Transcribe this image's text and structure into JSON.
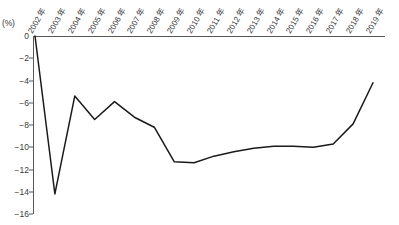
{
  "chart_data": {
    "type": "line",
    "title": "",
    "xlabel": "",
    "ylabel": "(%)",
    "categories": [
      "2002 年",
      "2003 年",
      "2004 年",
      "2005 年",
      "2006 年",
      "2007 年",
      "2008 年",
      "2009 年",
      "2010 年",
      "2011 年",
      "2012 年",
      "2013 年",
      "2014 年",
      "2015 年",
      "2016 年",
      "2017 年",
      "2018 年",
      "2019 年"
    ],
    "values": [
      0,
      -14.2,
      -5.4,
      -7.5,
      -5.9,
      -7.3,
      -8.2,
      -11.3,
      -11.4,
      -10.8,
      -10.4,
      -10.1,
      -9.9,
      -9.9,
      -10.0,
      -9.7,
      -7.9,
      -4.2
    ],
    "series": [
      {
        "name": "",
        "values": [
          0,
          -14.2,
          -5.4,
          -7.5,
          -5.9,
          -7.3,
          -8.2,
          -11.3,
          -11.4,
          -10.8,
          -10.4,
          -10.1,
          -9.9,
          -9.9,
          -10.0,
          -9.7,
          -7.9,
          -4.2
        ]
      }
    ],
    "ylim": [
      -16,
      0
    ],
    "yticks": [
      0,
      -2,
      -4,
      -6,
      -8,
      -10,
      -12,
      -14,
      -16
    ],
    "ytick_labels": [
      "0",
      "−2",
      "−4",
      "−6",
      "−8",
      "−10",
      "−12",
      "−14",
      "−16"
    ],
    "grid": false,
    "legend": "none",
    "line_color": "#1a1a1a",
    "axis_color": "#585858",
    "text_color": "#3a3a3a",
    "background": "#ffffff"
  },
  "axis": {
    "unit_label": "(%)"
  }
}
